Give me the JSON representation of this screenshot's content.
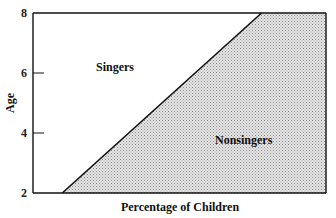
{
  "chart_data": {
    "type": "area",
    "title": "",
    "xlabel": "Percentage of Children",
    "ylabel": "Age",
    "xlim": [
      0,
      100
    ],
    "ylim": [
      2,
      8
    ],
    "yticks": [
      2,
      4,
      6,
      8
    ],
    "ytick_labels": [
      "2",
      "4",
      "6",
      "8"
    ],
    "grid": false,
    "boundary": {
      "name": "Singers / Nonsingers boundary",
      "points": [
        {
          "age": 2,
          "percent": 10
        },
        {
          "age": 8,
          "percent": 78
        }
      ]
    },
    "regions": [
      {
        "name": "Singers",
        "side": "left of boundary",
        "fill": "#ffffff"
      },
      {
        "name": "Nonsingers",
        "side": "right of boundary",
        "fill": "#d9d9d9",
        "pattern": "stipple"
      }
    ],
    "legend": "none"
  }
}
